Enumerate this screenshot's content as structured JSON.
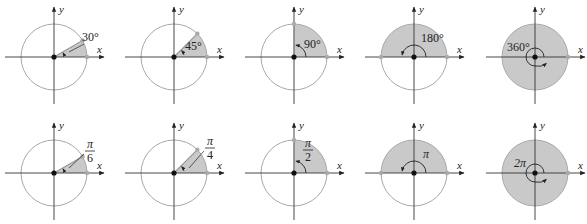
{
  "figure": {
    "colors": {
      "sector_fill": "#c9c9c9",
      "circle_stroke": "#a8a8a8",
      "axis": "#333333",
      "point": "#aaaaaa",
      "origin": "#111111",
      "text": "#222222"
    },
    "axis_labels": {
      "x": "x",
      "y": "y"
    },
    "rows": [
      {
        "name": "degrees",
        "panels": [
          {
            "angle_deg": 30,
            "label": "30°"
          },
          {
            "angle_deg": 45,
            "label": "45°"
          },
          {
            "angle_deg": 90,
            "label": "90°"
          },
          {
            "angle_deg": 180,
            "label": "180°"
          },
          {
            "angle_deg": 360,
            "label": "360°"
          }
        ]
      },
      {
        "name": "radians",
        "panels": [
          {
            "angle_deg": 30,
            "label_num": "π",
            "label_den": "6"
          },
          {
            "angle_deg": 45,
            "label_num": "π",
            "label_den": "4"
          },
          {
            "angle_deg": 90,
            "label_num": "π",
            "label_den": "2"
          },
          {
            "angle_deg": 180,
            "label": "π"
          },
          {
            "angle_deg": 360,
            "label": "2π"
          }
        ]
      }
    ]
  }
}
